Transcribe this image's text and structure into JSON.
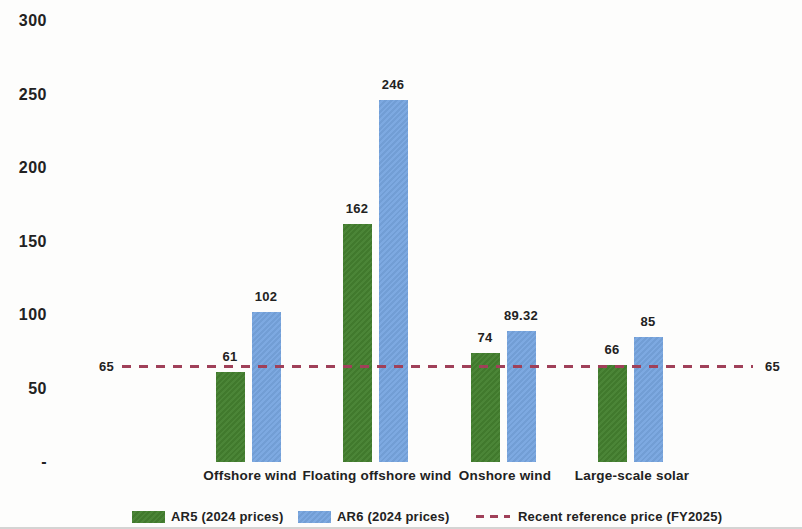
{
  "colors": {
    "ar5_green": "#44802f",
    "ar6_blue": "#78a6e0",
    "reference_red": "#a04059",
    "text": "#222222",
    "background": "#fdfdfc"
  },
  "chart_data": {
    "type": "grouped_bar",
    "categories": [
      "Offshore wind",
      "Floating offshore wind",
      "Onshore wind",
      "Large-scale solar"
    ],
    "series": [
      {
        "key": "ar5",
        "name": "AR5 (2024 prices)",
        "color_key": "ar5_green",
        "values": [
          61,
          162,
          74,
          66
        ],
        "labels": [
          "61",
          "162",
          "74",
          "66"
        ]
      },
      {
        "key": "ar6",
        "name": "AR6 (2024 prices)",
        "color_key": "ar6_blue",
        "values": [
          102,
          246,
          89.32,
          85
        ],
        "labels": [
          "102",
          "246",
          "89.32",
          "85"
        ]
      }
    ],
    "reference_line": {
      "value": 65,
      "label_left": "65",
      "label_right": "65",
      "name": "Recent reference price (FY2025)"
    },
    "ylim": [
      0,
      300
    ],
    "yticks": [
      {
        "value": 0,
        "label": "-"
      },
      {
        "value": 50,
        "label": "50"
      },
      {
        "value": 100,
        "label": "100"
      },
      {
        "value": 150,
        "label": "150"
      },
      {
        "value": 200,
        "label": "200"
      },
      {
        "value": 250,
        "label": "250"
      },
      {
        "value": 300,
        "label": "300"
      }
    ],
    "grid": false,
    "legend_position": "bottom"
  }
}
